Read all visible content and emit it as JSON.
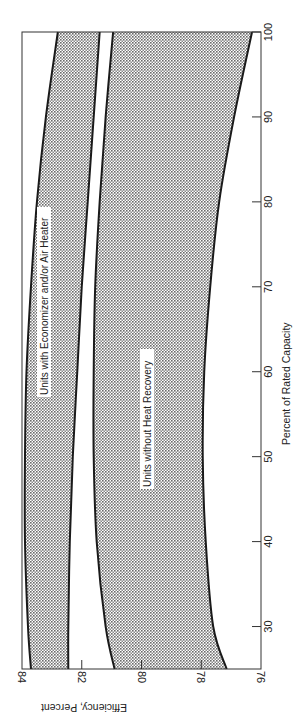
{
  "chart_data": {
    "type": "area",
    "orientation": "rotated-90-clockwise",
    "title": "",
    "xlabel": "Percent of Rated Capacity",
    "ylabel": "Efficiency, Percent",
    "xlim": [
      25,
      100
    ],
    "ylim": [
      76,
      84
    ],
    "x_ticks": [
      30,
      40,
      50,
      60,
      70,
      80,
      90,
      100
    ],
    "y_ticks": [
      76,
      78,
      80,
      82,
      84
    ],
    "grid": false,
    "legend": null,
    "x": [
      25,
      30,
      40,
      50,
      60,
      70,
      80,
      90,
      100
    ],
    "series": [
      {
        "name": "Units with Economizer and/or Air Heater",
        "kind": "band",
        "upper": [
          83.7,
          83.8,
          83.9,
          83.9,
          83.85,
          83.7,
          83.5,
          83.2,
          82.8
        ],
        "lower": [
          82.45,
          82.45,
          82.4,
          82.3,
          82.15,
          82.0,
          81.8,
          81.6,
          81.4
        ]
      },
      {
        "name": "Units without Heat Recovery",
        "kind": "band",
        "upper": [
          80.9,
          81.2,
          81.5,
          81.6,
          81.6,
          81.55,
          81.4,
          81.2,
          80.95
        ],
        "lower": [
          77.15,
          77.6,
          77.85,
          77.95,
          77.9,
          77.7,
          77.4,
          76.9,
          76.3
        ]
      }
    ],
    "annotations": [
      "Units with Economizer and/or Air Heater",
      "Units without Heat Recovery"
    ]
  },
  "labels": {
    "x_axis_title": "Percent of Rated Capacity",
    "y_axis_title": "Efficiency, Percent",
    "band_upper": "Units with Economizer and/or Air Heater",
    "band_lower": "Units without Heat Recovery",
    "x_ticks": [
      "30",
      "40",
      "50",
      "60",
      "70",
      "80",
      "90",
      "100"
    ],
    "y_ticks": [
      "84",
      "82",
      "80",
      "78",
      "76"
    ]
  },
  "colors": {
    "fill": "#b8b8b8",
    "line": "#1a1a1a",
    "frame": "#333333"
  }
}
